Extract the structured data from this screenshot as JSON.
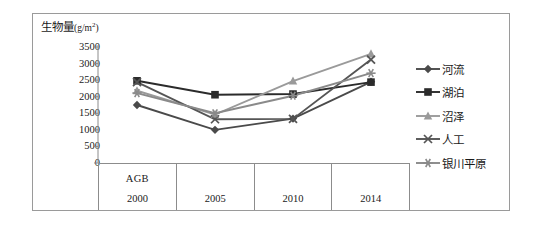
{
  "chart_data": {
    "type": "line",
    "title": "",
    "ylabel": "生物量(g/m²)",
    "xlabel": "AGB",
    "categories": [
      "2000",
      "2005",
      "2010",
      "2014"
    ],
    "ylim": [
      0,
      3500
    ],
    "ytick_labels": [
      "3500",
      "3000",
      "2500",
      "2000",
      "1500",
      "1000",
      "500",
      "0"
    ],
    "ytick_values": [
      3500,
      3000,
      2500,
      2000,
      1500,
      1000,
      500,
      0
    ],
    "grid": false,
    "legend_position": "right",
    "series": [
      {
        "name": "河流",
        "marker": "diamond",
        "color": "#4a4a4a",
        "values": [
          1750,
          1000,
          1340,
          2450
        ]
      },
      {
        "name": "湖泊",
        "marker": "square",
        "color": "#2b2b2b",
        "values": [
          2480,
          2060,
          2080,
          2440
        ]
      },
      {
        "name": "沼泽",
        "marker": "triangle",
        "color": "#9a9a9a",
        "values": [
          2180,
          1460,
          2470,
          3290
        ]
      },
      {
        "name": "人工",
        "marker": "x",
        "color": "#555555",
        "values": [
          2440,
          1320,
          1330,
          3120
        ]
      },
      {
        "name": "银川平原",
        "marker": "star",
        "color": "#8a8a8a",
        "values": [
          2110,
          1500,
          2030,
          2710
        ]
      }
    ]
  },
  "axis": {
    "y_title_main": "生物量",
    "y_title_unit_open": "(g/m",
    "y_title_unit_sup": "2",
    "y_title_unit_close": ")"
  },
  "x_table": {
    "agb_label": "AGB",
    "columns": [
      {
        "year": "2000",
        "agb": "AGB"
      },
      {
        "year": "2005",
        "agb": ""
      },
      {
        "year": "2010",
        "agb": ""
      },
      {
        "year": "2014",
        "agb": ""
      }
    ]
  }
}
